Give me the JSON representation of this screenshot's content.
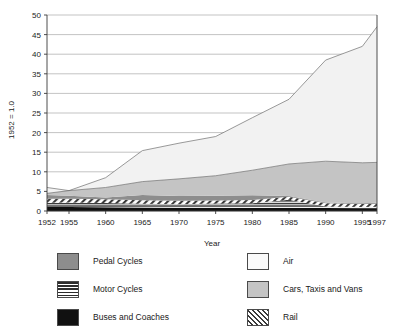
{
  "chart_data": {
    "type": "area",
    "stacked": true,
    "title": "",
    "xlabel": "Year",
    "ylabel": "1952 = 1.0",
    "xlim": [
      1952,
      1997
    ],
    "ylim": [
      0,
      50
    ],
    "ytick_step": 5,
    "grid": true,
    "legend_position": "bottom",
    "x": [
      1952,
      1955,
      1960,
      1965,
      1970,
      1975,
      1980,
      1985,
      1990,
      1995,
      1997
    ],
    "xtick_labels": [
      "1952",
      "1955",
      "1960",
      "1965",
      "1970",
      "1975",
      "1980",
      "1985",
      "1990",
      "1995",
      "1997"
    ],
    "ytick_labels": [
      "0",
      "5",
      "10",
      "15",
      "20",
      "25",
      "30",
      "35",
      "40",
      "45",
      "50"
    ],
    "series": [
      {
        "name": "Buses and Coaches",
        "fill": "#111111",
        "pattern": "solid-black",
        "values": [
          1.0,
          1.0,
          0.95,
          0.9,
          0.85,
          0.8,
          0.78,
          0.75,
          0.75,
          0.72,
          0.7
        ]
      },
      {
        "name": "Motor Cycles",
        "fill": "#2b2b2b",
        "pattern": "horizontal-stripes",
        "values": [
          1.1,
          1.15,
          1.1,
          0.95,
          0.7,
          0.6,
          0.62,
          0.5,
          0.4,
          0.38,
          0.38
        ]
      },
      {
        "name": "Rail",
        "fill": "#3a3a3a",
        "pattern": "diagonal-hatch",
        "values": [
          1.0,
          1.0,
          0.95,
          0.9,
          0.85,
          0.8,
          0.8,
          0.8,
          0.85,
          0.8,
          0.8
        ]
      },
      {
        "name": "Pedal Cycles",
        "fill": "#8d8d8d",
        "pattern": "solid-gray",
        "values": [
          1.0,
          0.75,
          0.45,
          0.3,
          0.22,
          0.2,
          0.2,
          0.2,
          0.2,
          0.2,
          0.2
        ]
      },
      {
        "name": "Cars, Taxis and Vans",
        "fill": "#c4c4c4",
        "pattern": "solid-light-gray",
        "values": [
          0.4,
          1.3,
          2.55,
          3.45,
          4.38,
          5.1,
          6.4,
          8.15,
          10.5,
          10.3,
          10.32
        ]
      },
      {
        "name": "Air",
        "fill": "#f0f0f0",
        "pattern": "solid-near-white",
        "values": [
          1.5,
          0.0,
          2.5,
          7.9,
          4.5,
          3.5,
          6.3,
          9.6,
          10.0,
          5.6,
          8.5
        ]
      }
    ],
    "cumulative_totals": [
      6.0,
      5.2,
      8.5,
      15.4,
      17.3,
      19.0,
      23.8,
      28.5,
      38.5,
      42.0,
      47.0
    ],
    "air_boundary": [
      6.0,
      5.2,
      8.5,
      15.4,
      17.3,
      19.0,
      23.8,
      28.5,
      38.5,
      42.0,
      47.0
    ],
    "cars_boundary": [
      4.5,
      5.2,
      6.0,
      7.5,
      8.2,
      9.0,
      10.4,
      12.0,
      12.7,
      12.3,
      12.4
    ],
    "pedal_boundary": [
      4.1,
      3.9,
      3.45,
      4.05,
      3.82,
      3.9,
      4.0,
      3.85,
      2.2,
      2.0,
      2.08
    ],
    "rail_boundary": [
      3.1,
      3.15,
      3.0,
      2.75,
      2.6,
      2.7,
      2.8,
      3.65,
      2.0,
      1.8,
      1.88
    ],
    "motor_boundary": [
      2.1,
      2.15,
      2.05,
      1.85,
      1.75,
      1.9,
      2.0,
      2.85,
      1.15,
      1.0,
      1.08
    ],
    "buses_boundary": [
      1.0,
      1.0,
      0.95,
      0.9,
      0.85,
      0.8,
      0.78,
      0.75,
      0.75,
      0.72,
      0.7
    ]
  },
  "legend": {
    "left_column": [
      {
        "label": "Pedal Cycles",
        "swatch": "sw-pedal"
      },
      {
        "label": "Motor Cycles",
        "swatch": "sw-motor"
      },
      {
        "label": "Buses and Coaches",
        "swatch": "sw-buses"
      }
    ],
    "right_column": [
      {
        "label": "Air",
        "swatch": "sw-air"
      },
      {
        "label": "Cars, Taxis and Vans",
        "swatch": "sw-cars"
      },
      {
        "label": "Rail",
        "swatch": "sw-rail"
      }
    ]
  }
}
